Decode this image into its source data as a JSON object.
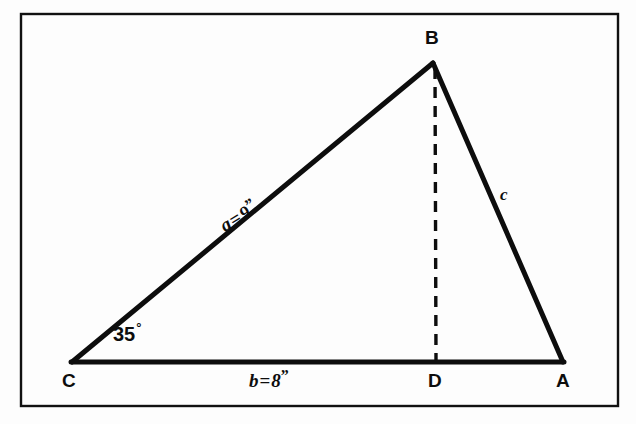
{
  "figure": {
    "frame": {
      "stroke_color": "#111111"
    },
    "line_color": "#0d0d0d",
    "background_color": "#fdfdfd",
    "vertices": [
      {
        "id": "A",
        "label": "A",
        "x": 563,
        "y": 362
      },
      {
        "id": "B",
        "label": "B",
        "x": 433,
        "y": 63
      },
      {
        "id": "C",
        "label": "C",
        "x": 72,
        "y": 363
      },
      {
        "id": "D",
        "label": "D",
        "x": 436,
        "y": 362
      }
    ],
    "sides": [
      {
        "id": "a",
        "name": "side-a",
        "from": "C",
        "to": "B",
        "label_var": "a",
        "equals": "=",
        "value": "9",
        "unit": "”"
      },
      {
        "id": "b",
        "name": "side-b",
        "from": "C",
        "to": "A",
        "label_var": "b",
        "equals": "=",
        "value": "8",
        "unit": "”"
      },
      {
        "id": "c",
        "name": "side-c",
        "from": "B",
        "to": "A",
        "label_var": "c",
        "equals": "",
        "value": "",
        "unit": ""
      }
    ],
    "angle": {
      "at": "C",
      "value": "35",
      "degree_symbol": "°"
    },
    "altitude": {
      "from": "B",
      "to": "D",
      "style": "dashed"
    }
  }
}
